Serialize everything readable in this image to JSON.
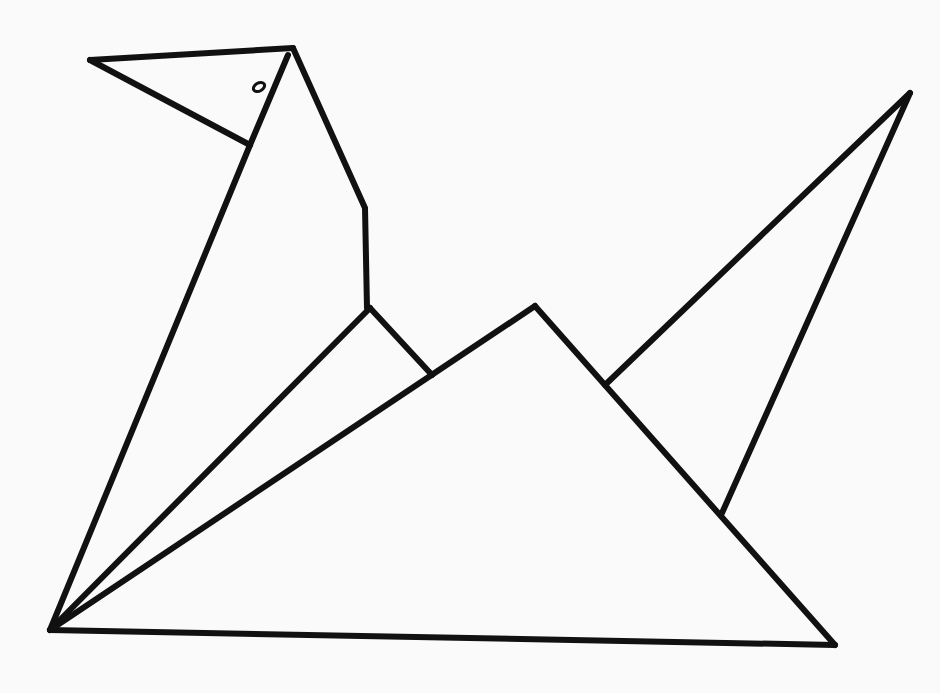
{
  "figure": {
    "background_color": "#fafafa",
    "stroke_color": "#111111",
    "stroke_width": 6,
    "eye": {
      "cx": 259,
      "cy": 87,
      "rx": 6,
      "ry": 4
    },
    "lines": [
      {
        "name": "beak-top",
        "points": [
          [
            90,
            60
          ],
          [
            293,
            48
          ]
        ]
      },
      {
        "name": "beak-bottom",
        "points": [
          [
            90,
            60
          ],
          [
            250,
            145
          ]
        ]
      },
      {
        "name": "head-front",
        "points": [
          [
            288,
            55
          ],
          [
            250,
            145
          ]
        ]
      },
      {
        "name": "back-of-neck",
        "points": [
          [
            293,
            48
          ],
          [
            365,
            208
          ],
          [
            367,
            308
          ]
        ]
      },
      {
        "name": "front-body-edge",
        "points": [
          [
            250,
            145
          ],
          [
            50,
            630
          ]
        ]
      },
      {
        "name": "inner-fold-1",
        "points": [
          [
            50,
            630
          ],
          [
            370,
            308
          ]
        ]
      },
      {
        "name": "neck-fold",
        "points": [
          [
            370,
            308
          ],
          [
            432,
            375
          ]
        ]
      },
      {
        "name": "inner-fold-2",
        "points": [
          [
            50,
            630
          ],
          [
            535,
            306
          ]
        ]
      },
      {
        "name": "center-peak-right",
        "points": [
          [
            535,
            306
          ],
          [
            835,
            645
          ]
        ]
      },
      {
        "name": "base",
        "points": [
          [
            50,
            630
          ],
          [
            835,
            645
          ]
        ]
      },
      {
        "name": "tail-upper",
        "points": [
          [
            605,
            385
          ],
          [
            910,
            93
          ]
        ]
      },
      {
        "name": "tail-lower",
        "points": [
          [
            910,
            93
          ],
          [
            722,
            513
          ]
        ]
      }
    ]
  }
}
